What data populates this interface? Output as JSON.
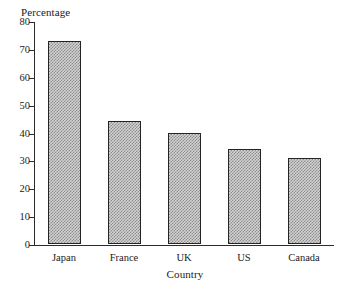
{
  "chart_data": {
    "type": "bar",
    "title": "",
    "xlabel": "Country",
    "ylabel": "Percentage",
    "categories": [
      "Japan",
      "France",
      "UK",
      "US",
      "Canada"
    ],
    "values": [
      73,
      44,
      40,
      34,
      31
    ],
    "ylim": [
      0,
      80
    ],
    "ytick_labels": [
      "0",
      "10",
      "20",
      "30",
      "40",
      "50",
      "60",
      "70",
      "80"
    ],
    "ytick_values": [
      0,
      10,
      20,
      30,
      40,
      50,
      60,
      70,
      80
    ],
    "grid": false,
    "legend": null,
    "bar_fill_color": "#d2d2d2",
    "bar_pattern": "dithered-gray-checker",
    "bar_edge_color": "#242424",
    "axis_color": "#2b2b2b",
    "background_color": "#ffffff"
  },
  "axes": {
    "y_title": "Percentage",
    "x_title": "Country"
  }
}
